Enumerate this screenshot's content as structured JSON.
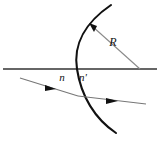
{
  "figure": {
    "name": "refraction-at-spherical-surface",
    "background_color": "#ffffff",
    "line_color": "#1a1a1a",
    "thin_line_color": "#555555",
    "width": 160,
    "height": 141
  },
  "labels": {
    "index_before": "n",
    "index_after": "n'",
    "radius": "R"
  },
  "geometry": {
    "optical_axis": {
      "x1": 3,
      "y1": 69,
      "x2": 157,
      "y2": 69
    },
    "spherical_surface": {
      "vertex_x": 77,
      "vertex_y": 69,
      "top_end_x": 111,
      "top_end_y": 5,
      "bottom_end_x": 116,
      "bottom_end_y": 133,
      "bulge_direction": "left"
    },
    "center_of_curvature": {
      "x": 140,
      "y": 69
    },
    "radius_line": {
      "x1": 140,
      "y1": 69,
      "x2": 90,
      "y2": 24,
      "arrow_at": "surface"
    },
    "incident_ray": {
      "x1": 20,
      "y1": 78,
      "x2": 78,
      "y2": 96,
      "arrow_fraction": 0.55
    },
    "refracted_ray": {
      "x1": 78,
      "y1": 96,
      "x2": 146,
      "y2": 104,
      "arrow_fraction": 0.6
    },
    "label_positions": {
      "index_before": {
        "x": 62,
        "y": 81
      },
      "index_after": {
        "x": 82,
        "y": 81
      },
      "radius": {
        "x": 113,
        "y": 46
      }
    }
  }
}
